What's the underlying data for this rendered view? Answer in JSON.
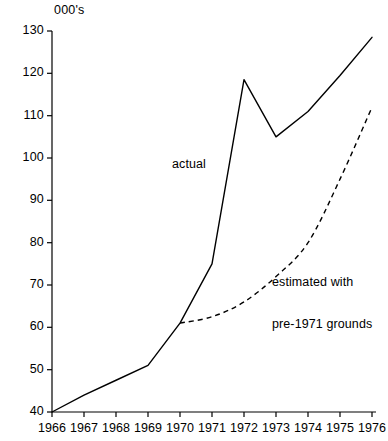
{
  "chart_data": {
    "type": "line",
    "title": "",
    "unit_label": "000's",
    "xlabel": "",
    "ylabel": "",
    "x": [
      1966,
      1967,
      1968,
      1969,
      1970,
      1971,
      1972,
      1973,
      1974,
      1975,
      1976
    ],
    "xtick_labels": [
      "1966",
      "1967",
      "1968",
      "1969",
      "1970",
      "1971",
      "1972",
      "1973",
      "1974",
      "1975",
      "1976"
    ],
    "xlim": [
      1966,
      1976
    ],
    "ylim": [
      40,
      130
    ],
    "ytick_labels": [
      "130",
      "120",
      "110",
      "100",
      "90",
      "80",
      "70",
      "60",
      "50",
      "40"
    ],
    "yticks": [
      130,
      120,
      110,
      100,
      90,
      80,
      70,
      60,
      50,
      40
    ],
    "grid": false,
    "legend_position": "inline-annotations",
    "series": [
      {
        "name": "actual",
        "style": "solid",
        "color": "#000000",
        "x": [
          1966,
          1967,
          1968,
          1969,
          1970,
          1971,
          1972,
          1973,
          1974,
          1975,
          1976
        ],
        "values": [
          40,
          44,
          47.5,
          51,
          61,
          75,
          118.5,
          105,
          111,
          119.5,
          128.5
        ]
      },
      {
        "name": "estimated with pre-1971 grounds",
        "style": "dashed",
        "color": "#000000",
        "x": [
          1970,
          1971,
          1972,
          1973,
          1974,
          1975,
          1976
        ],
        "values": [
          61,
          62.5,
          66,
          72,
          80,
          95,
          112
        ]
      }
    ],
    "annotations": [
      {
        "text": "actual",
        "x": 1971,
        "y": 101
      },
      {
        "text": "estimated with\npre-1971 grounds",
        "x": 1973.9,
        "y": 80
      }
    ]
  },
  "axes": {
    "unit_title": "000's",
    "y_ticks": [
      {
        "label": "130",
        "y": 31
      },
      {
        "label": "120",
        "y": 73.3
      },
      {
        "label": "110",
        "y": 115.7
      },
      {
        "label": "100",
        "y": 158
      },
      {
        "label": "90",
        "y": 200.3
      },
      {
        "label": "80",
        "y": 242.7
      },
      {
        "label": "70",
        "y": 285
      },
      {
        "label": "60",
        "y": 327.3
      },
      {
        "label": "50",
        "y": 369.7
      },
      {
        "label": "40",
        "y": 412
      }
    ],
    "x_ticks": [
      {
        "label": "1966",
        "x": 52
      },
      {
        "label": "1967",
        "x": 84
      },
      {
        "label": "1968",
        "x": 116
      },
      {
        "label": "1969",
        "x": 148
      },
      {
        "label": "1970",
        "x": 180
      },
      {
        "label": "1971",
        "x": 212
      },
      {
        "label": "1972",
        "x": 244
      },
      {
        "label": "1973",
        "x": 276
      },
      {
        "label": "1974",
        "x": 308
      },
      {
        "label": "1975",
        "x": 340
      },
      {
        "label": "1976",
        "x": 372
      }
    ]
  },
  "annotations": {
    "actual": "actual",
    "estimated_line1": "estimated with",
    "estimated_line2": "pre-1971 grounds"
  },
  "colors": {
    "line": "#000000",
    "axis": "#000000",
    "background": "#ffffff"
  }
}
